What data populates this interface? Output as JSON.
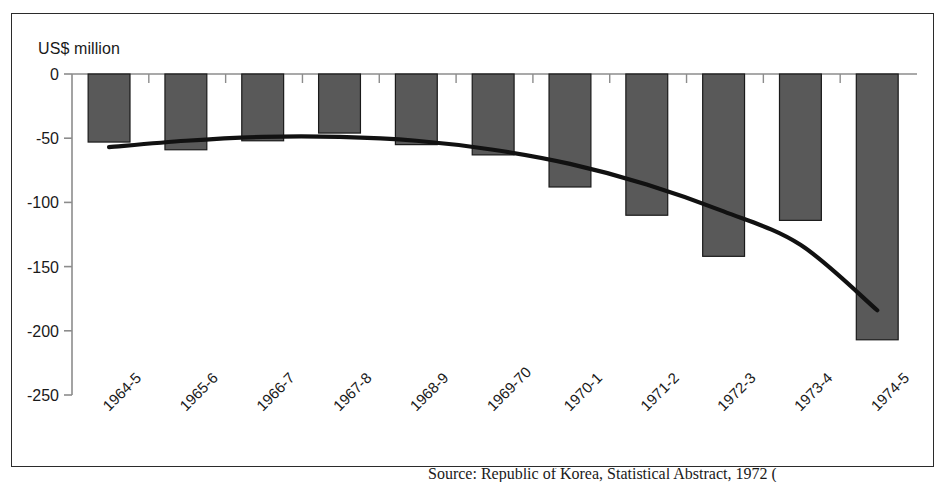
{
  "figure": {
    "axis_unit_label": "US$ million",
    "caption_partial": "Source: Republic of Korea, Statistical Abstract, 1972 ("
  },
  "chart_data": {
    "type": "bar",
    "title": "",
    "subtitle": "",
    "xlabel": "",
    "ylabel": "US$ million",
    "ylim": [
      -250,
      0
    ],
    "yticks": [
      0,
      -50,
      -100,
      -150,
      -200,
      -250
    ],
    "ytick_labels": [
      "0",
      "-50",
      "-100",
      "-150",
      "-200",
      "-250"
    ],
    "grid": false,
    "legend": "none",
    "categories": [
      "1964-5",
      "1965-6",
      "1966-7",
      "1967-8",
      "1968-9",
      "1969-70",
      "1970-1",
      "1971-2",
      "1972-3",
      "1973-4",
      "1974-5"
    ],
    "series": [
      {
        "name": "Trade balance",
        "type": "bar",
        "values": [
          -53,
          -59,
          -52,
          -46,
          -55,
          -63,
          -88,
          -110,
          -142,
          -114,
          -207
        ]
      },
      {
        "name": "Trend (polynomial)",
        "type": "line",
        "values": [
          -57,
          -52,
          -49,
          -49,
          -52,
          -59,
          -70,
          -86,
          -107,
          -133,
          -184
        ]
      }
    ],
    "colors": {
      "bar_fill": "#595959",
      "bar_stroke": "#1a1a1a",
      "trend_line": "#111111",
      "axis": "#8c8c8c",
      "frame": "#2b2b2b",
      "background": "#ffffff"
    }
  }
}
